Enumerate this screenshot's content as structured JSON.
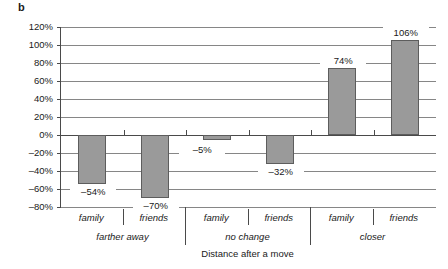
{
  "figure": {
    "panel_letter": "b",
    "y_axis_title": "Change in frequency of calls",
    "x_axis_title": "Distance after a move"
  },
  "chart_data": {
    "type": "bar",
    "title": "",
    "xlabel": "Distance after a move",
    "ylabel": "Change in frequency of calls",
    "ylim": [
      -80,
      120
    ],
    "ytick_labels": [
      "120%",
      "100%",
      "80%",
      "60%",
      "40%",
      "20%",
      "0%",
      "–20%",
      "–40%",
      "–60%",
      "–80%"
    ],
    "ytick_values": [
      120,
      100,
      80,
      60,
      40,
      20,
      0,
      -20,
      -40,
      -60,
      -80
    ],
    "grid": true,
    "legend": "none",
    "categories": [
      "family",
      "friends",
      "family",
      "friends",
      "family",
      "friends"
    ],
    "groups": [
      {
        "label": "farther away",
        "categories": [
          "family",
          "friends"
        ]
      },
      {
        "label": "no change",
        "categories": [
          "family",
          "friends"
        ]
      },
      {
        "label": "closer",
        "categories": [
          "family",
          "friends"
        ]
      }
    ],
    "values": [
      -54,
      -70,
      -5,
      -32,
      74,
      106
    ],
    "value_labels": [
      "–54%",
      "–70%",
      "–5%",
      "–32%",
      "74%",
      "106%"
    ],
    "bar_color": "#9a9a9a",
    "bar_edge_color": "#5d5d5d"
  },
  "bars": [
    {
      "name": "farther-away-family",
      "label": "–54%",
      "value": -54
    },
    {
      "name": "farther-away-friends",
      "label": "–70%",
      "value": -70
    },
    {
      "name": "no-change-family",
      "label": "–5%",
      "value": -5
    },
    {
      "name": "no-change-friends",
      "label": "–32%",
      "value": -32
    },
    {
      "name": "closer-family",
      "label": "74%",
      "value": 74
    },
    {
      "name": "closer-friends",
      "label": "106%",
      "value": 106
    }
  ]
}
